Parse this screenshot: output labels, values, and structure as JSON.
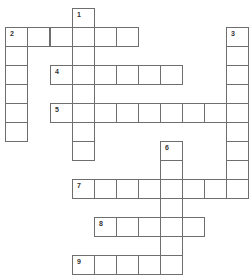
{
  "puzzle": {
    "type": "crossword",
    "grid_rows": 14,
    "grid_cols": 11,
    "colors": {
      "cell_border": "#6e6e6e",
      "cell_fill": "#ffffff",
      "number": "#333333"
    },
    "entries": [
      {
        "number": "1",
        "direction": "down",
        "row": 0,
        "col": 3,
        "length": 8
      },
      {
        "number": "2",
        "direction": "across",
        "row": 1,
        "col": 0,
        "length": 6
      },
      {
        "number": "2",
        "direction": "down",
        "row": 1,
        "col": 0,
        "length": 6
      },
      {
        "number": "3",
        "direction": "down",
        "row": 1,
        "col": 10,
        "length": 9
      },
      {
        "number": "4",
        "direction": "across",
        "row": 3,
        "col": 2,
        "length": 6
      },
      {
        "number": "5",
        "direction": "across",
        "row": 5,
        "col": 2,
        "length": 9
      },
      {
        "number": "6",
        "direction": "down",
        "row": 7,
        "col": 7,
        "length": 7
      },
      {
        "number": "7",
        "direction": "across",
        "row": 9,
        "col": 3,
        "length": 8
      },
      {
        "number": "8",
        "direction": "across",
        "row": 11,
        "col": 4,
        "length": 5
      },
      {
        "number": "9",
        "direction": "across",
        "row": 13,
        "col": 3,
        "length": 5
      }
    ]
  }
}
